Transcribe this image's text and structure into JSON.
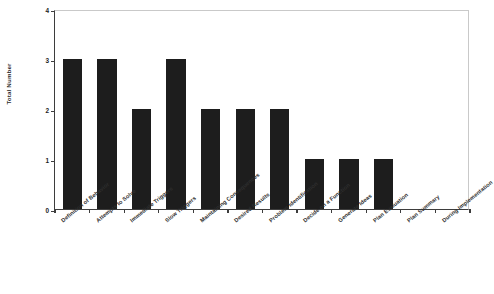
{
  "chart_data": {
    "type": "bar",
    "title": "",
    "xlabel": "",
    "ylabel": "Total Number",
    "ylim": [
      0,
      4
    ],
    "yticks": [
      0,
      1,
      2,
      3,
      4
    ],
    "grid": false,
    "legend": null,
    "bar_color": "#1d1d1d",
    "background_color": "#ffffff",
    "axis_color": "#3d3d3d",
    "frame_color": "#c9c9c9",
    "label_rotation_degrees": -39,
    "categories": [
      "Definition of Behavior",
      "Attempts to Solve",
      "Immediate Triggers",
      "Slow Triggers",
      "Maintaining Consequences",
      "Desired Results",
      "Problem Identification",
      "Decide on a Function",
      "Generate Ideas",
      "Plan Evaluation",
      "Plan Summary",
      "During Implementation"
    ],
    "values": [
      3,
      3,
      2,
      3,
      2,
      2,
      2,
      1,
      1,
      1,
      0,
      0
    ]
  }
}
